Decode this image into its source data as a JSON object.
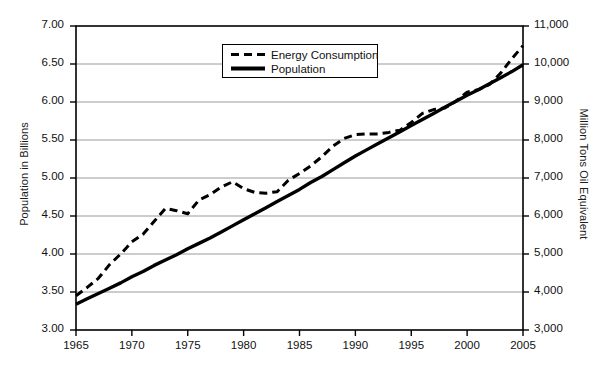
{
  "figure": {
    "background_color": "#ffffff",
    "line_color": "#000000",
    "grid_color": "#9a9a9a",
    "axis_color": "#000000"
  },
  "legend": {
    "position": "top-center-inside",
    "entries": [
      {
        "label": "Energy Consumption",
        "style": "dashed",
        "swatch": "dashed-line-swatch"
      },
      {
        "label": "Population",
        "style": "solid",
        "swatch": "solid-line-swatch"
      }
    ]
  },
  "axes": {
    "x": {
      "label": "",
      "ticks": [
        "1965",
        "1970",
        "1975",
        "1980",
        "1985",
        "1990",
        "1995",
        "2000",
        "2005"
      ],
      "min": 1965,
      "max": 2005
    },
    "y_left": {
      "label": "Population in Billions",
      "ticks": [
        "3.00",
        "3.50",
        "4.00",
        "4.50",
        "5.00",
        "5.50",
        "6.00",
        "6.50",
        "7.00"
      ],
      "min": 3.0,
      "max": 7.0
    },
    "y_right": {
      "label": "Million Tons Oil Equivalent",
      "ticks": [
        "3,000",
        "4,000",
        "5,000",
        "6,000",
        "7,000",
        "8,000",
        "9,000",
        "10,000",
        "11,000"
      ],
      "min": 3000,
      "max": 11000
    }
  },
  "chart_data": {
    "type": "line",
    "title": "",
    "xlabel": "",
    "ylabel": "Population in Billions",
    "y2label": "Million Tons Oil Equivalent",
    "xlim": [
      1965,
      2005
    ],
    "ylim": [
      3.0,
      7.0
    ],
    "y2lim": [
      3000,
      11000
    ],
    "grid": true,
    "legend_position": "upper center",
    "x": [
      1965,
      1966,
      1967,
      1968,
      1969,
      1970,
      1971,
      1972,
      1973,
      1974,
      1975,
      1976,
      1977,
      1978,
      1979,
      1980,
      1981,
      1982,
      1983,
      1984,
      1985,
      1986,
      1987,
      1988,
      1989,
      1990,
      1991,
      1992,
      1993,
      1994,
      1995,
      1996,
      1997,
      1998,
      1999,
      2000,
      2001,
      2002,
      2003,
      2004,
      2005
    ],
    "series": [
      {
        "name": "Population",
        "axis": "left",
        "style": "solid",
        "units": "billions",
        "values": [
          3.34,
          3.41,
          3.48,
          3.55,
          3.62,
          3.7,
          3.77,
          3.85,
          3.92,
          3.99,
          4.07,
          4.14,
          4.21,
          4.29,
          4.37,
          4.45,
          4.53,
          4.61,
          4.69,
          4.77,
          4.85,
          4.94,
          5.02,
          5.11,
          5.2,
          5.29,
          5.37,
          5.45,
          5.53,
          5.61,
          5.69,
          5.77,
          5.85,
          5.93,
          6.01,
          6.09,
          6.16,
          6.24,
          6.32,
          6.4,
          6.49
        ]
      },
      {
        "name": "Energy Consumption",
        "axis": "right",
        "style": "dashed",
        "units": "million tons oil equivalent",
        "values_left_scale": [
          3.45,
          3.56,
          3.68,
          3.86,
          4.0,
          4.16,
          4.26,
          4.43,
          4.6,
          4.57,
          4.53,
          4.71,
          4.78,
          4.88,
          4.95,
          4.86,
          4.81,
          4.8,
          4.82,
          4.97,
          5.06,
          5.16,
          5.28,
          5.42,
          5.52,
          5.57,
          5.58,
          5.58,
          5.6,
          5.63,
          5.73,
          5.85,
          5.9,
          5.92,
          6.01,
          6.13,
          6.16,
          6.23,
          6.38,
          6.57,
          6.74
        ],
        "values": [
          3900,
          4120,
          4360,
          4720,
          5000,
          5320,
          5520,
          5860,
          6200,
          6140,
          6060,
          6420,
          6560,
          6760,
          6900,
          6720,
          6620,
          6600,
          6640,
          6940,
          7120,
          7320,
          7560,
          7840,
          8040,
          8140,
          8160,
          8160,
          8200,
          8260,
          8460,
          8700,
          8800,
          8840,
          9020,
          9260,
          9320,
          9460,
          9760,
          10140,
          10480
        ]
      }
    ]
  }
}
